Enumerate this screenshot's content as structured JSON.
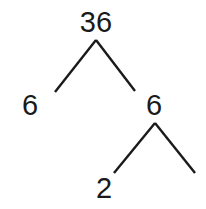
{
  "diagram": {
    "type": "factor-tree",
    "line_color": "#1a1a1a",
    "nodes": [
      {
        "id": "root",
        "label": "36",
        "x": 96,
        "y": 8
      },
      {
        "id": "left",
        "label": "6",
        "x": 30,
        "y": 91
      },
      {
        "id": "right",
        "label": "6",
        "x": 154,
        "y": 91
      },
      {
        "id": "right-left",
        "label": "2",
        "x": 104,
        "y": 174
      }
    ],
    "edges": [
      {
        "from": "root",
        "to": "left",
        "x1": 96,
        "y1": 40,
        "x2": 55,
        "y2": 92
      },
      {
        "from": "root",
        "to": "right",
        "x1": 96,
        "y1": 40,
        "x2": 135,
        "y2": 91
      },
      {
        "from": "right",
        "to": "right-left",
        "x1": 155,
        "y1": 123,
        "x2": 114,
        "y2": 173
      },
      {
        "from": "right",
        "to": "right-right",
        "x1": 155,
        "y1": 123,
        "x2": 195,
        "y2": 173
      }
    ]
  }
}
